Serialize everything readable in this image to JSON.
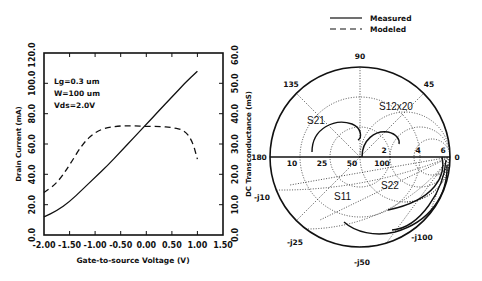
{
  "chart_data": [
    {
      "type": "line",
      "title": "",
      "xlabel": "Gate-to-source Voltage (V)",
      "ylabel": "Drain Current (mA)",
      "y2label": "DC Transconductance (mS)",
      "xlim": [
        -2.0,
        1.5
      ],
      "ylim": [
        0,
        120
      ],
      "y2lim": [
        0,
        60
      ],
      "xticks": [
        "-2.00",
        "-1.50",
        "-1.00",
        "-0.50",
        "0.00",
        "0.50",
        "1.00",
        "1.50"
      ],
      "yticks": [
        "0.0",
        "20.0",
        "40.0",
        "60.0",
        "80.0",
        "100.0",
        "120.0"
      ],
      "y2ticks": [
        "0.0",
        "10.0",
        "20.0",
        "30.0",
        "40.0",
        "50.0",
        "60.0"
      ],
      "annotations": [
        "Lg=0.3 um",
        "W=100 um",
        "Vds=2.0V"
      ],
      "series": [
        {
          "name": "Drain Current (mA)",
          "style": "solid",
          "axis": "left",
          "x": [
            -2.0,
            -1.75,
            -1.5,
            -1.25,
            -1.0,
            -0.75,
            -0.5,
            -0.25,
            0.0,
            0.25,
            0.5,
            0.75,
            1.0
          ],
          "y": [
            12,
            16,
            22,
            30,
            38,
            46,
            55,
            64,
            73,
            82,
            91,
            100,
            108
          ]
        },
        {
          "name": "DC Transconductance (mS)",
          "style": "dashed",
          "axis": "right",
          "x": [
            -2.0,
            -1.75,
            -1.5,
            -1.25,
            -1.0,
            -0.75,
            -0.5,
            -0.25,
            0.0,
            0.25,
            0.5,
            0.75,
            0.9,
            1.0
          ],
          "y": [
            14,
            17,
            23,
            30,
            34,
            35.5,
            36,
            36,
            35.8,
            35.8,
            35.5,
            34.5,
            31,
            25
          ]
        }
      ]
    },
    {
      "type": "smith",
      "title": "",
      "legend": [
        {
          "label": "Measured",
          "style": "solid"
        },
        {
          "label": "Modeled",
          "style": "dashed"
        }
      ],
      "angle_labels": [
        "90",
        "135",
        "45",
        "180",
        "0",
        "-j10",
        "-j25",
        "-j50",
        "-j100"
      ],
      "real_axis_labels": [
        "10",
        "25",
        "50",
        "100",
        "2",
        "4",
        "6"
      ],
      "traces": [
        "S21",
        "S12x20",
        "S11",
        "S22"
      ]
    }
  ],
  "legend": {
    "measured": "Measured",
    "modeled": "Modeled"
  },
  "left_chart": {
    "xlabel": "Gate-to-source Voltage (V)",
    "ylabel": "Drain Current (mA)",
    "y2label": "DC Transconductance (mS)",
    "xticks": [
      "-2.00",
      "-1.50",
      "-1.00",
      "-0.50",
      "0.00",
      "0.50",
      "1.00",
      "1.50"
    ],
    "yticks": [
      "0.0",
      "20.0",
      "40.0",
      "60.0",
      "80.0",
      "100.0",
      "120.0"
    ],
    "y2ticks": [
      "0.0",
      "10.0",
      "20.0",
      "30.0",
      "40.0",
      "50.0",
      "60.0"
    ],
    "ann1": "Lg=0.3 um",
    "ann2": "W=100 um",
    "ann3": "Vds=2.0V"
  },
  "smith": {
    "a90": "90",
    "a135": "135",
    "a45": "45",
    "a180": "180",
    "a0": "0",
    "jm10": "-j10",
    "jm25": "-j25",
    "jm50": "-j50",
    "jm100": "-j100",
    "r10": "10",
    "r25": "25",
    "r50": "50",
    "r100": "100",
    "m2": "2",
    "m4": "4",
    "m6": "6",
    "s21": "S21",
    "s12": "S12x20",
    "s11": "S11",
    "s22": "S22"
  }
}
